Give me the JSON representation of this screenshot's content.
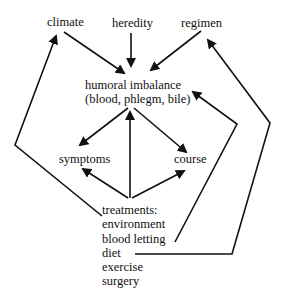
{
  "diagram": {
    "nodes": {
      "climate": "climate",
      "heredity": "heredity",
      "regimen": "regimen",
      "humoral_line1": "humoral imbalance",
      "humoral_line2": "(blood, phlegm, bile)",
      "symptoms": "symptoms",
      "course": "course",
      "treatments_header": "treatments:",
      "treatments": [
        "environment",
        "blood letting",
        "diet",
        "exercise",
        "surgery"
      ]
    },
    "edges": [
      {
        "from": "climate",
        "to": "humoral imbalance"
      },
      {
        "from": "heredity",
        "to": "humoral imbalance"
      },
      {
        "from": "regimen",
        "to": "humoral imbalance"
      },
      {
        "from": "humoral imbalance",
        "to": "symptoms"
      },
      {
        "from": "humoral imbalance",
        "to": "course"
      },
      {
        "from": "treatments",
        "to": "humoral imbalance"
      },
      {
        "from": "treatments",
        "to": "symptoms"
      },
      {
        "from": "treatments",
        "to": "course"
      },
      {
        "from": "environment",
        "to": "climate"
      },
      {
        "from": "blood letting",
        "to": "humoral imbalance"
      },
      {
        "from": "diet",
        "to": "regimen"
      }
    ]
  }
}
